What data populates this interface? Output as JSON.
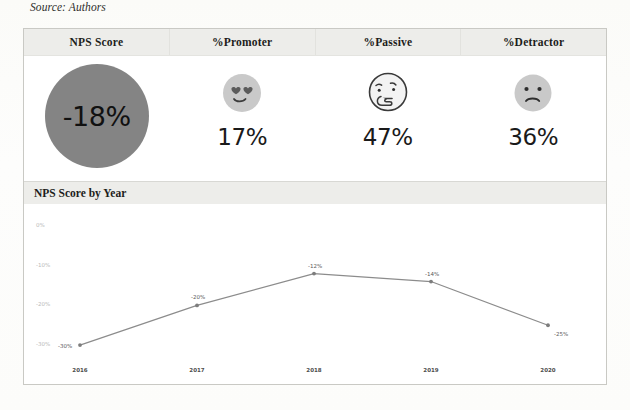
{
  "page": {
    "source_note": "Source: Authors",
    "clipped_top_line": "                              "
  },
  "dashboard": {
    "kpi_columns": [
      {
        "label": "NPS Score",
        "value": "-18%",
        "icon": "gray-circle",
        "type": "circle"
      },
      {
        "label": "%Promoter",
        "value": "17%",
        "icon": "heart-eyes-face-icon",
        "type": "emoji"
      },
      {
        "label": "%Passive",
        "value": "47%",
        "icon": "thinking-face-icon",
        "type": "emoji"
      },
      {
        "label": "%Detractor",
        "value": "36%",
        "icon": "frowning-face-icon",
        "type": "emoji"
      }
    ],
    "chart_title": "NPS Score by Year"
  },
  "colors": {
    "nps_circle": "#848484",
    "header_band": "#ededea",
    "line": "#8c8c8c",
    "card_border": "#c9c9c4",
    "emoji_fill": "#c6c6c6",
    "axis_text": "#b9b9b9"
  },
  "chart_data": {
    "type": "line",
    "title": "NPS Score by Year",
    "xlabel": "",
    "ylabel": "",
    "categories": [
      "2016",
      "2017",
      "2018",
      "2019",
      "2020"
    ],
    "values": [
      -30,
      -20,
      -12,
      -14,
      -25
    ],
    "point_labels": [
      "-30%",
      "-20%",
      "-12%",
      "-14%",
      "-25%"
    ],
    "ytick_values": [
      0,
      -10,
      -20,
      -30
    ],
    "ytick_labels": [
      "0%",
      "-10%",
      "-20%",
      "-30%"
    ],
    "ylim": [
      -33,
      1
    ],
    "grid": false,
    "legend": false,
    "series": [
      {
        "name": "NPS Score",
        "values": [
          -30,
          -20,
          -12,
          -14,
          -25
        ]
      }
    ]
  }
}
